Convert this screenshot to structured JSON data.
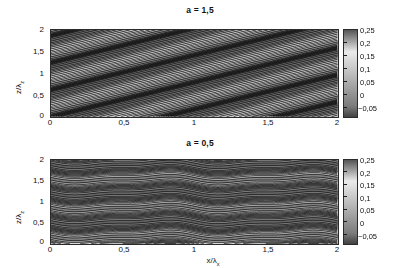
{
  "figure": {
    "background": "#ffffff",
    "colormap": "grayscale-jet-like",
    "panels": [
      {
        "id": "top",
        "title": "a = 1,5",
        "xlabel": "",
        "ylabel": "z/λ",
        "ylabel_sub": "z",
        "xticks": [
          "0",
          "0,5",
          "1",
          "1,5",
          "2"
        ],
        "yticks": [
          "0",
          "0,5",
          "1",
          "1,5",
          "2"
        ],
        "xlim": [
          0,
          2
        ],
        "ylim": [
          0,
          2
        ],
        "colorbar_ticks": [
          "0,25",
          "0,2",
          "0,15",
          "0,1",
          "0,05",
          "0",
          "−0,05"
        ]
      },
      {
        "id": "bottom",
        "title": "a = 0,5",
        "xlabel": "x/λ",
        "xlabel_sub": "x",
        "ylabel": "z/λ",
        "ylabel_sub": "z",
        "xticks": [
          "0",
          "0,5",
          "1",
          "1,5",
          "2"
        ],
        "yticks": [
          "0",
          "0,5",
          "1",
          "1,5",
          "2"
        ],
        "xlim": [
          0,
          2
        ],
        "ylim": [
          0,
          2
        ],
        "colorbar_ticks": [
          "0,25",
          "0,2",
          "0,15",
          "0,1",
          "0,05",
          "0",
          "−0,05"
        ]
      }
    ]
  },
  "chart_data": [
    {
      "type": "heatmap",
      "title": "a = 1,5",
      "xlabel": "",
      "ylabel": "z/λ_z",
      "xlim": [
        0,
        2
      ],
      "ylim": [
        0,
        2
      ],
      "zlim": [
        -0.05,
        0.25
      ],
      "grid": false,
      "colorbar": {
        "position": "right",
        "ticks": [
          0.25,
          0.2,
          0.15,
          0.1,
          0.05,
          0,
          -0.05
        ],
        "tick_labels": [
          "0,25",
          "0,2",
          "0,15",
          "0,1",
          "0,05",
          "0",
          "−0,05"
        ],
        "cmap": "gray"
      },
      "xticks": [
        0,
        0.5,
        1,
        1.5,
        2
      ],
      "xtick_labels": [
        "0",
        "0,5",
        "1",
        "1,5",
        "2"
      ],
      "yticks": [
        0,
        0.5,
        1,
        1.5,
        2
      ],
      "ytick_labels": [
        "0",
        "0,5",
        "1",
        "1,5",
        "2"
      ],
      "field": {
        "formula": "f(x,z) = 0.10 + 0.12*sin(2*pi*(z - a*x)) scaled, with steepened / sheared phase",
        "shear_parameter_a": 1.5,
        "amplitude": 0.15,
        "mean_level": 0.1,
        "contour_levels": [
          -0.025,
          0.0,
          0.025,
          0.05,
          0.075,
          0.1,
          0.125,
          0.15,
          0.175,
          0.2,
          0.225
        ],
        "contour_shape": "steeply inclined S-shaped (overturning) isolines",
        "contour_color": "#1a1a1a"
      }
    },
    {
      "type": "heatmap",
      "title": "a = 0,5",
      "xlabel": "x/λ_x",
      "ylabel": "z/λ_z",
      "xlim": [
        0,
        2
      ],
      "ylim": [
        0,
        2
      ],
      "zlim": [
        -0.05,
        0.25
      ],
      "grid": false,
      "colorbar": {
        "position": "right",
        "ticks": [
          0.25,
          0.2,
          0.15,
          0.1,
          0.05,
          0,
          -0.05
        ],
        "tick_labels": [
          "0,25",
          "0,2",
          "0,15",
          "0,1",
          "0,05",
          "0",
          "−0,05"
        ],
        "cmap": "gray"
      },
      "xticks": [
        0,
        0.5,
        1,
        1.5,
        2
      ],
      "xtick_labels": [
        "0",
        "0,5",
        "1",
        "1,5",
        "2"
      ],
      "yticks": [
        0,
        0.5,
        1,
        1.5,
        2
      ],
      "ytick_labels": [
        "0",
        "0,5",
        "1",
        "1,5",
        "2"
      ],
      "field": {
        "formula": "f(x,z) = 0.10 + 0.12*sin(2*pi*z + a*sin(2*pi*x))",
        "shear_parameter_a": 0.5,
        "amplitude": 0.15,
        "mean_level": 0.1,
        "contour_levels": [
          -0.025,
          0.0,
          0.025,
          0.05,
          0.075,
          0.1,
          0.125,
          0.15,
          0.175,
          0.2,
          0.225
        ],
        "contour_shape": "gently undulating near-horizontal isolines",
        "contour_color": "#1a1a1a"
      }
    }
  ]
}
